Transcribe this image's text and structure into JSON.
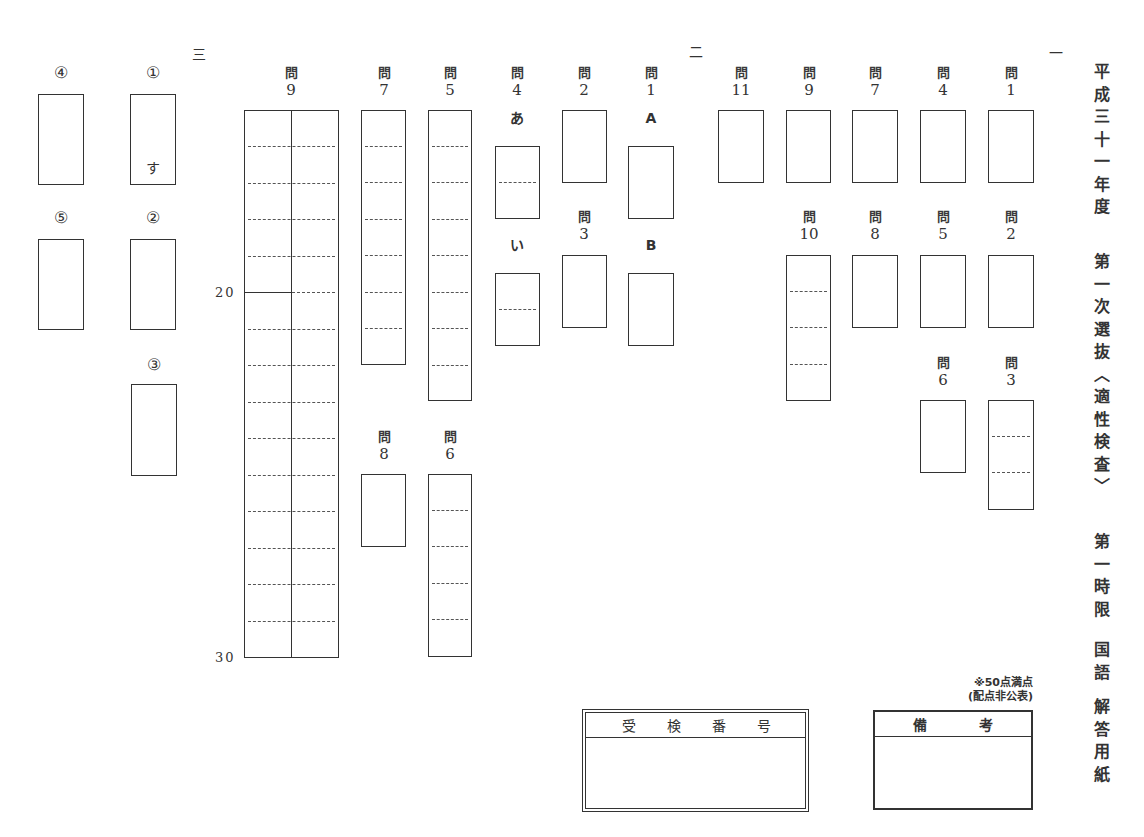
{
  "title": {
    "groups": [
      "平成三十一年度",
      "第一次選抜〈適性検査〉",
      "第一時限",
      "国語",
      "解答用紙"
    ]
  },
  "sections": {
    "ichi": {
      "marker": "一",
      "questions": [
        {
          "prefix": "問",
          "number": "1"
        },
        {
          "prefix": "問",
          "number": "2"
        },
        {
          "prefix": "問",
          "number": "3"
        },
        {
          "prefix": "問",
          "number": "4"
        },
        {
          "prefix": "問",
          "number": "5"
        },
        {
          "prefix": "問",
          "number": "6"
        },
        {
          "prefix": "問",
          "number": "7"
        },
        {
          "prefix": "問",
          "number": "8"
        },
        {
          "prefix": "問",
          "number": "9"
        },
        {
          "prefix": "問",
          "number": "10"
        },
        {
          "prefix": "問",
          "number": "11"
        }
      ]
    },
    "ni": {
      "marker": "二",
      "questions": [
        {
          "prefix": "問",
          "number": "1",
          "parts": [
            "A",
            "B"
          ]
        },
        {
          "prefix": "問",
          "number": "2"
        },
        {
          "prefix": "問",
          "number": "3"
        },
        {
          "prefix": "問",
          "number": "4",
          "parts": [
            "あ",
            "い"
          ]
        }
      ]
    },
    "san": {
      "marker": "三",
      "kanji": [
        {
          "label": "①",
          "prefilled": "す"
        },
        {
          "label": "②"
        },
        {
          "label": "③"
        },
        {
          "label": "④"
        },
        {
          "label": "⑤"
        }
      ],
      "questions": [
        {
          "prefix": "問",
          "number": "5"
        },
        {
          "prefix": "問",
          "number": "6"
        },
        {
          "prefix": "問",
          "number": "7"
        },
        {
          "prefix": "問",
          "number": "8"
        },
        {
          "prefix": "問",
          "number": "9"
        }
      ],
      "char_count_labels": [
        "20",
        "30"
      ]
    }
  },
  "exam_number": {
    "label_chars": [
      "受",
      "検",
      "番",
      "号"
    ],
    "value": ""
  },
  "remarks": {
    "label_chars": [
      "備",
      "考"
    ],
    "value": ""
  },
  "score_note": {
    "line1": "※50点満点",
    "line2": "(配点非公表)"
  }
}
